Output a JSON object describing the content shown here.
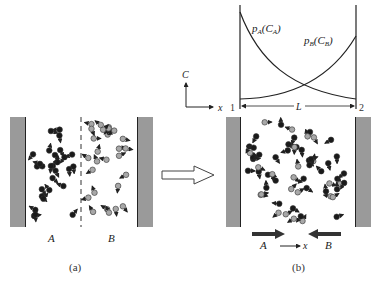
{
  "panel_a": {
    "caption": "(a)",
    "label_left": "A",
    "label_right": "B",
    "wall_color": "#9a9a9a",
    "particle_A_color": "#1a1a1a",
    "particle_B_color": "#a8a8a8"
  },
  "panel_b": {
    "caption": "(b)",
    "label_left": "A",
    "label_right": "B",
    "axis_x_label": "x",
    "flux_arrow_A": "A",
    "flux_arrow_B": "B"
  },
  "graph": {
    "curve_A_label": "p",
    "curve_A_sub": "A",
    "curve_A_arg_open": "(C",
    "curve_A_arg_sub": "A",
    "curve_A_arg_close": ")",
    "curve_B_label": "p",
    "curve_B_sub": "B",
    "curve_B_arg_open": "(C",
    "curve_B_arg_sub": "B",
    "curve_B_arg_close": ")",
    "axis_y_label": "C",
    "axis_x_label": "x",
    "point_left": "1",
    "point_right": "2",
    "length_label": "L"
  },
  "transition_arrow": "hollow-right-arrow"
}
